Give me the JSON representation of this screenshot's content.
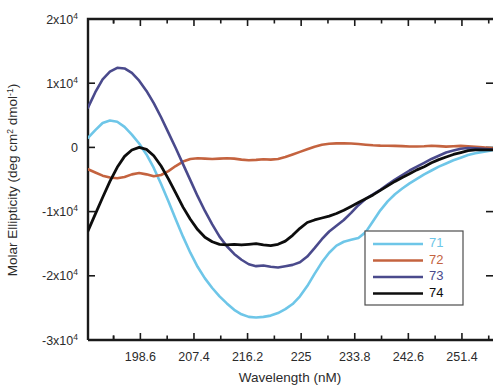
{
  "chart_data": {
    "type": "line",
    "title": "",
    "xlabel": "Wavelength (nM)",
    "ylabel": "Molar Ellipticity (deg cm2 dmol-1)",
    "ylabel_display": "Molar Ellipticity (deg cm² dmol⁻¹)",
    "xlim": [
      190.0,
      256.5
    ],
    "ylim": [
      -30000,
      20000
    ],
    "xticks": [
      198.6,
      207.4,
      216.2,
      225,
      233.8,
      242.6,
      251.4
    ],
    "xticklabels": [
      "198.6",
      "207.4",
      "216.2",
      "225",
      "233.8",
      "242.6",
      "251.4"
    ],
    "xminor_count": 1,
    "yticks": [
      20000,
      10000,
      0,
      -10000,
      -20000,
      -30000
    ],
    "yticklabels": [
      "2x10⁴",
      "1x10⁴",
      "0",
      "-1x10⁴",
      "-2x10⁴",
      "-3x10⁴"
    ],
    "ytick_mantissa": [
      "2",
      "1",
      "0",
      "-1",
      "-2",
      "-3"
    ],
    "ytick_base": [
      "x10",
      "x10",
      "",
      "x10",
      "x10",
      "x10"
    ],
    "ytick_exp": [
      "4",
      "4",
      "",
      "4",
      "4",
      "4"
    ],
    "grid": false,
    "legend_position": "lower-right",
    "series": [
      {
        "name": "71",
        "color": "#6ec6e8",
        "width": 2.6,
        "x": [
          190.0,
          191.2,
          192.4,
          193.6,
          194.8,
          196.0,
          197.2,
          198.4,
          199.6,
          200.8,
          202.0,
          203.2,
          204.4,
          205.6,
          206.8,
          208.0,
          209.2,
          210.4,
          211.6,
          212.8,
          214.0,
          215.2,
          216.4,
          217.6,
          218.8,
          220.0,
          221.2,
          222.4,
          223.6,
          224.8,
          226.0,
          227.2,
          228.4,
          229.6,
          230.8,
          232.0,
          233.2,
          234.4,
          235.6,
          236.8,
          238.0,
          239.2,
          240.4,
          241.6,
          242.8,
          244.0,
          245.2,
          246.4,
          247.6,
          248.8,
          250.0,
          251.2,
          252.4,
          253.6,
          254.8,
          256.0,
          256.5
        ],
        "y": [
          1500,
          2700,
          3800,
          4200,
          4000,
          3200,
          2000,
          600,
          -1100,
          -3200,
          -5700,
          -8400,
          -11200,
          -13900,
          -16400,
          -18600,
          -20400,
          -21900,
          -23200,
          -24300,
          -25300,
          -26000,
          -26400,
          -26500,
          -26400,
          -26200,
          -25800,
          -25200,
          -24400,
          -23200,
          -21600,
          -19700,
          -17900,
          -16400,
          -15300,
          -14700,
          -14400,
          -14100,
          -13200,
          -11500,
          -9800,
          -8400,
          -7300,
          -6400,
          -5600,
          -4900,
          -4200,
          -3600,
          -3000,
          -2500,
          -2000,
          -1600,
          -1200,
          -900,
          -700,
          -500,
          -400
        ]
      },
      {
        "name": "72",
        "color": "#c4633f",
        "width": 2.6,
        "x": [
          190.0,
          191.2,
          192.4,
          193.6,
          194.8,
          196.0,
          197.2,
          198.4,
          199.6,
          200.8,
          202.0,
          203.2,
          204.4,
          205.6,
          206.8,
          208.0,
          209.2,
          210.4,
          211.6,
          212.8,
          214.0,
          215.2,
          216.4,
          217.6,
          218.8,
          220.0,
          221.2,
          222.4,
          223.6,
          224.8,
          226.0,
          227.2,
          228.4,
          229.6,
          230.8,
          232.0,
          233.2,
          234.4,
          235.6,
          236.8,
          238.0,
          239.2,
          240.4,
          241.6,
          242.8,
          244.0,
          245.2,
          246.4,
          247.6,
          248.8,
          250.0,
          251.2,
          252.4,
          253.6,
          254.8,
          256.0,
          256.5
        ],
        "y": [
          -3400,
          -3900,
          -4400,
          -4700,
          -4800,
          -4600,
          -4200,
          -4000,
          -4200,
          -4500,
          -4300,
          -3700,
          -2900,
          -2200,
          -1800,
          -1700,
          -1750,
          -1800,
          -1750,
          -1700,
          -1750,
          -1900,
          -2000,
          -1950,
          -1850,
          -1900,
          -1800,
          -1500,
          -1100,
          -700,
          -300,
          100,
          400,
          560,
          620,
          640,
          600,
          520,
          420,
          330,
          280,
          260,
          240,
          200,
          150,
          130,
          180,
          260,
          200,
          120,
          180,
          240,
          180,
          100,
          20,
          -100,
          -200
        ]
      },
      {
        "name": "73",
        "color": "#4a4a8c",
        "width": 2.6,
        "x": [
          190.0,
          191.2,
          192.4,
          193.6,
          194.8,
          196.0,
          197.2,
          198.4,
          199.6,
          200.8,
          202.0,
          203.2,
          204.4,
          205.6,
          206.8,
          208.0,
          209.2,
          210.4,
          211.6,
          212.8,
          214.0,
          215.2,
          216.4,
          217.6,
          218.8,
          220.0,
          221.2,
          222.4,
          223.6,
          224.8,
          226.0,
          227.2,
          228.4,
          229.6,
          230.8,
          232.0,
          233.2,
          234.4,
          235.6,
          236.8,
          238.0,
          239.2,
          240.4,
          241.6,
          242.8,
          244.0,
          245.2,
          246.4,
          247.6,
          248.8,
          250.0,
          251.2,
          252.4,
          253.6,
          254.8,
          256.0,
          256.5
        ],
        "y": [
          6200,
          8600,
          10600,
          11800,
          12400,
          12300,
          11600,
          10400,
          8800,
          6900,
          4700,
          2300,
          -100,
          -2600,
          -5100,
          -7600,
          -9900,
          -12000,
          -13900,
          -15400,
          -16600,
          -17500,
          -18200,
          -18500,
          -18400,
          -18600,
          -18700,
          -18500,
          -18300,
          -17900,
          -17000,
          -15700,
          -14300,
          -13100,
          -12200,
          -11300,
          -10200,
          -9000,
          -8000,
          -7300,
          -6600,
          -5800,
          -5000,
          -4300,
          -3600,
          -3000,
          -2400,
          -1800,
          -1300,
          -800,
          -500,
          -200,
          -100,
          -150,
          -200,
          -300,
          -350
        ]
      },
      {
        "name": "74",
        "color": "#0d0d0d",
        "width": 2.8,
        "x": [
          190.0,
          191.2,
          192.4,
          193.6,
          194.8,
          196.0,
          197.2,
          198.4,
          199.6,
          200.8,
          202.0,
          203.2,
          204.4,
          205.6,
          206.8,
          208.0,
          209.2,
          210.4,
          211.6,
          212.8,
          214.0,
          215.2,
          216.4,
          217.6,
          218.8,
          220.0,
          221.2,
          222.4,
          223.6,
          224.8,
          226.0,
          227.2,
          228.4,
          229.6,
          230.8,
          232.0,
          233.2,
          234.4,
          235.6,
          236.8,
          238.0,
          239.2,
          240.4,
          241.6,
          242.8,
          244.0,
          245.2,
          246.4,
          247.6,
          248.8,
          250.0,
          251.2,
          252.4,
          253.6,
          254.8,
          256.0,
          256.5
        ],
        "y": [
          -13000,
          -10400,
          -7800,
          -5300,
          -3100,
          -1400,
          -400,
          0,
          -300,
          -1300,
          -2900,
          -4900,
          -7100,
          -9300,
          -11200,
          -12800,
          -14000,
          -14700,
          -15100,
          -15200,
          -15100,
          -15200,
          -15100,
          -15000,
          -15200,
          -15300,
          -15100,
          -14600,
          -13700,
          -12600,
          -11700,
          -11300,
          -11000,
          -10700,
          -10300,
          -9800,
          -9200,
          -8600,
          -8000,
          -7400,
          -6700,
          -6000,
          -5300,
          -4700,
          -4100,
          -3500,
          -3000,
          -2400,
          -1900,
          -1500,
          -1100,
          -800,
          -500,
          -400,
          -400,
          -400,
          -400
        ]
      }
    ],
    "legend_entries": [
      {
        "label": "71",
        "color": "#6ec6e8"
      },
      {
        "label": "72",
        "color": "#c4633f"
      },
      {
        "label": "73",
        "color": "#4a4a8c"
      },
      {
        "label": "74",
        "color": "#0d0d0d"
      }
    ]
  }
}
